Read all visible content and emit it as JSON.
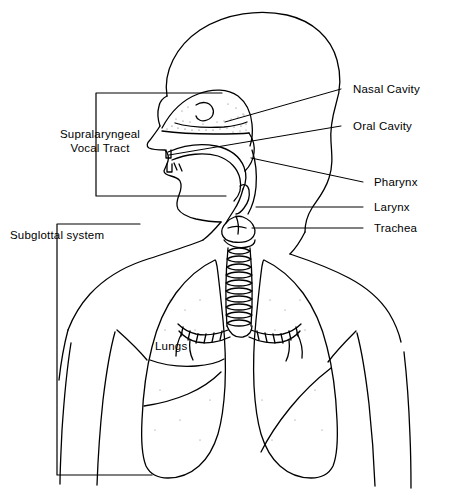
{
  "diagram": {
    "stroke_color": "#000000",
    "background_color": "#ffffff",
    "width": 457,
    "height": 501
  },
  "labels": {
    "nasal_cavity": "Nasal Cavity",
    "oral_cavity": "Oral Cavity",
    "pharynx": "Pharynx",
    "larynx": "Larynx",
    "trachea": "Trachea",
    "lungs": "Lungs",
    "supralaryngeal_line1": "Supralaryngeal",
    "supralaryngeal_line2": "Vocal Tract",
    "subglottal": "Subglottal system"
  },
  "parts": [
    {
      "name": "nasal-cavity",
      "label": "Nasal Cavity",
      "side": "right"
    },
    {
      "name": "oral-cavity",
      "label": "Oral Cavity",
      "side": "right"
    },
    {
      "name": "pharynx",
      "label": "Pharynx",
      "side": "right"
    },
    {
      "name": "larynx",
      "label": "Larynx",
      "side": "right"
    },
    {
      "name": "trachea",
      "label": "Trachea",
      "side": "right"
    },
    {
      "name": "lungs",
      "label": "Lungs",
      "side": "inline"
    },
    {
      "name": "supralaryngeal-vocal-tract",
      "label": "Supralaryngeal Vocal Tract",
      "side": "left-bracket"
    },
    {
      "name": "subglottal-system",
      "label": "Subglottal system",
      "side": "left-bracket"
    }
  ]
}
